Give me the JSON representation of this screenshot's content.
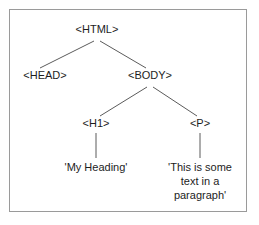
{
  "diagram": {
    "type": "tree",
    "frame": {
      "border_color": "#9a9a9a",
      "background_color": "#ffffff"
    },
    "style": {
      "line_color": "#5b5b5b",
      "text_color": "#1d1d1d"
    },
    "nodes": [
      {
        "id": "html",
        "label": "<HTML>",
        "x": 97,
        "y": 30,
        "level": 0
      },
      {
        "id": "head",
        "label": "<HEAD>",
        "x": 45,
        "y": 76,
        "level": 1
      },
      {
        "id": "body",
        "label": "<BODY>",
        "x": 150,
        "y": 76,
        "level": 1
      },
      {
        "id": "h1",
        "label": "<H1>",
        "x": 96,
        "y": 124,
        "level": 2
      },
      {
        "id": "p",
        "label": "<P>",
        "x": 200,
        "y": 124,
        "level": 2
      }
    ],
    "leaves": [
      {
        "id": "heading-text",
        "x": 96,
        "y": 168,
        "lines": [
          "'My Heading'"
        ]
      },
      {
        "id": "paragraph-text",
        "x": 200,
        "y": 168,
        "lines": [
          "'This is some",
          "text in a",
          "paragraph'"
        ]
      }
    ],
    "edges": [
      {
        "id": "html-head",
        "from": "html",
        "to": "head",
        "x1": 94,
        "y1": 41,
        "x2": 40,
        "y2": 68
      },
      {
        "id": "html-body",
        "from": "html",
        "to": "body",
        "x1": 100,
        "y1": 41,
        "x2": 146,
        "y2": 68
      },
      {
        "id": "body-h1",
        "from": "body",
        "to": "h1",
        "x1": 147,
        "y1": 87,
        "x2": 100,
        "y2": 116
      },
      {
        "id": "body-p",
        "from": "body",
        "to": "p",
        "x1": 153,
        "y1": 87,
        "x2": 197,
        "y2": 116
      },
      {
        "id": "h1-text",
        "from": "h1",
        "to": "heading-text",
        "x1": 96,
        "y1": 133,
        "x2": 96,
        "y2": 158
      },
      {
        "id": "p-text",
        "from": "p",
        "to": "paragraph-text",
        "x1": 200,
        "y1": 133,
        "x2": 200,
        "y2": 158
      }
    ]
  }
}
